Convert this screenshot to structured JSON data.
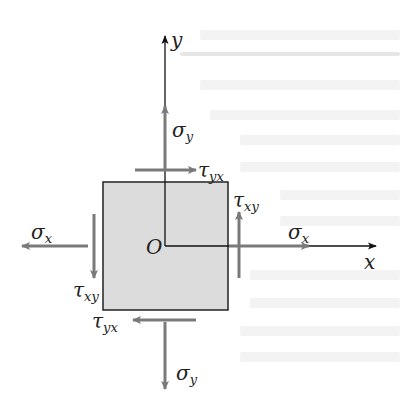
{
  "diagram": {
    "axes": {
      "x_label": "x",
      "y_label": "y",
      "origin_label": "O"
    },
    "colors": {
      "element_fill": "#dcdcdc",
      "element_border": "#222222",
      "stress_arrow": "#7a7a7a",
      "axis": "#111111",
      "text": "#222222"
    },
    "stresses": {
      "sigma_x_right": {
        "symbol": "σ",
        "sub": "x"
      },
      "sigma_x_left": {
        "symbol": "σ",
        "sub": "x"
      },
      "sigma_y_top": {
        "symbol": "σ",
        "sub": "y"
      },
      "sigma_y_bottom": {
        "symbol": "σ",
        "sub": "y"
      },
      "tau_yx_top": {
        "symbol": "τ",
        "sub": "yx"
      },
      "tau_yx_bottom": {
        "symbol": "τ",
        "sub": "yx"
      },
      "tau_xy_right": {
        "symbol": "τ",
        "sub": "xy"
      },
      "tau_xy_left": {
        "symbol": "τ",
        "sub": "xy"
      }
    }
  }
}
